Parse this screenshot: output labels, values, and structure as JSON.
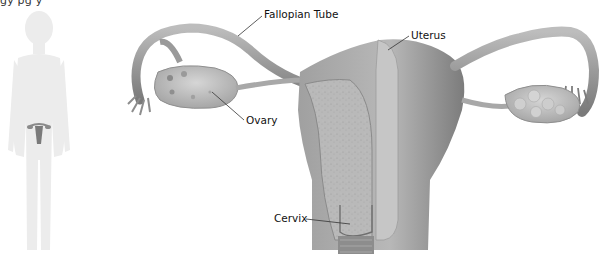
{
  "figure": {
    "top_text_fragment": "gy pg y",
    "body_figure": "female-silhouette-with-reproductive-system",
    "labels": {
      "fallopian_tube": "Fallopian Tube",
      "uterus": "Uterus",
      "ovary": "Ovary",
      "cervix": "Cervix"
    },
    "colors": {
      "background": "#ffffff",
      "organ_dark": "#8c8c8c",
      "organ_mid": "#a9a9a9",
      "organ_light": "#c8c8c8",
      "silhouette": "#ececec",
      "label_text": "#111111",
      "leader_line": "#333333"
    }
  }
}
